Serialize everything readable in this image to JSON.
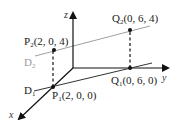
{
  "diagram": {
    "type": "3d-coordinate-lines",
    "axes": {
      "x": {
        "label": "x"
      },
      "y": {
        "label": "y"
      },
      "z": {
        "label": "z"
      }
    },
    "points": [
      {
        "id": "P1",
        "base": "P",
        "sub": "1",
        "coords": "(2, 0, 0)"
      },
      {
        "id": "Q1",
        "base": "Q",
        "sub": "1",
        "coords": "(0, 6, 0)"
      },
      {
        "id": "P2",
        "base": "P",
        "sub": "2",
        "coords": "(2, 0, 4)"
      },
      {
        "id": "Q2",
        "base": "Q",
        "sub": "2",
        "coords": "(0, 6, 4)"
      }
    ],
    "lines": [
      {
        "id": "D1",
        "base": "D",
        "sub": "1",
        "through": [
          "P1",
          "Q1"
        ],
        "color": "#333333"
      },
      {
        "id": "D2",
        "base": "D",
        "sub": "2",
        "through": [
          "P2",
          "Q2"
        ],
        "color": "#a0a0a0"
      }
    ],
    "colors": {
      "axis": "#111111",
      "line_d1": "#333333",
      "line_d2": "#a0a0a0",
      "dashed": "#111111",
      "text": "#222222",
      "text_gray": "#9a9a9a"
    }
  }
}
